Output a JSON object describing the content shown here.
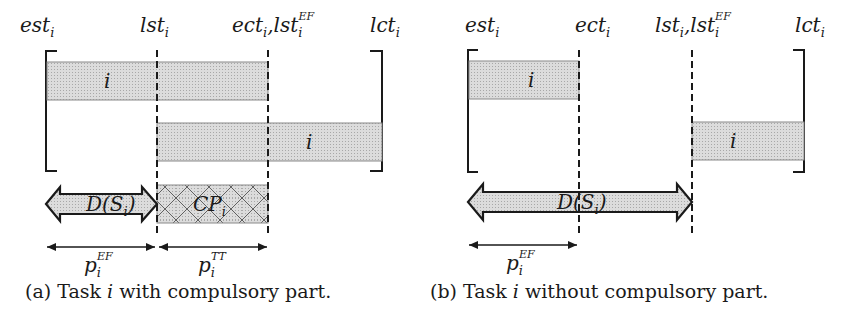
{
  "panels": [
    {
      "id": "a",
      "caption": {
        "prefix": "(a) Task ",
        "var": "i",
        "suffix": " with compulsory part."
      },
      "time_labels": [
        {
          "base": "est",
          "sub": "i"
        },
        {
          "base": "lst",
          "sub": "i"
        },
        {
          "base": "ect",
          "sub": "i",
          "extra_base": "lst",
          "extra_sub": "i",
          "extra_sup": "EF"
        },
        {
          "base": "lct",
          "sub": "i"
        }
      ],
      "bars": [
        {
          "label": "i",
          "position": "earliest"
        },
        {
          "label": "i",
          "position": "latest"
        }
      ],
      "domain_arrow": {
        "label": "D(S",
        "sub": "i",
        "close": ")"
      },
      "compulsory_part": {
        "label": "CP",
        "sub": "i"
      },
      "durations": [
        {
          "base": "p",
          "sub": "i",
          "sup": "EF"
        },
        {
          "base": "p",
          "sub": "i",
          "sup": "TT"
        }
      ]
    },
    {
      "id": "b",
      "caption": {
        "prefix": "(b) Task ",
        "var": "i",
        "suffix": " without compulsory part."
      },
      "time_labels": [
        {
          "base": "est",
          "sub": "i"
        },
        {
          "base": "ect",
          "sub": "i"
        },
        {
          "base": "lst",
          "sub": "i",
          "extra_base": "lst",
          "extra_sub": "i",
          "extra_sup": "EF"
        },
        {
          "base": "lct",
          "sub": "i"
        }
      ],
      "bars": [
        {
          "label": "i",
          "position": "earliest"
        },
        {
          "label": "i",
          "position": "latest"
        }
      ],
      "domain_arrow": {
        "label": "D(S",
        "sub": "i",
        "close": ")"
      },
      "durations": [
        {
          "base": "p",
          "sub": "i",
          "sup": "EF"
        }
      ]
    }
  ],
  "colors": {
    "bar_fill": "#d6d6d6",
    "bar_stroke": "#8a8a8a",
    "line": "#1a1a1a"
  }
}
